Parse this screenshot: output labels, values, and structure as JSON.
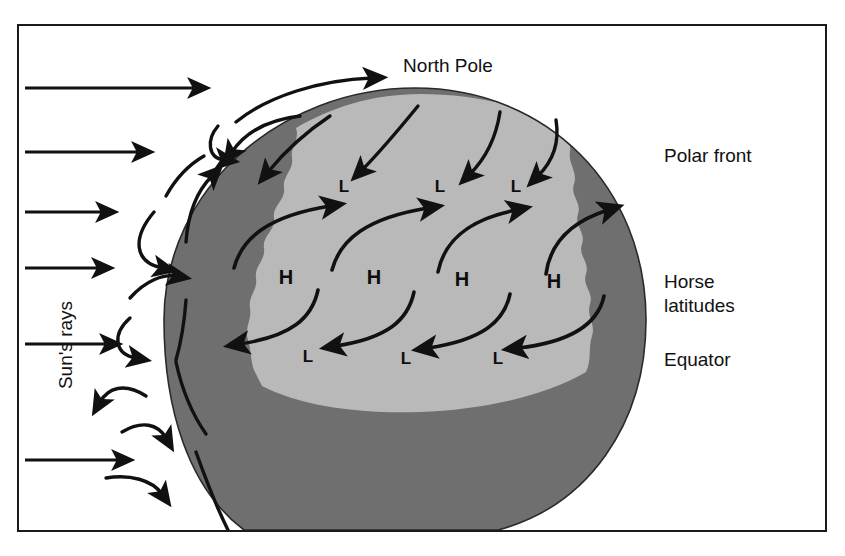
{
  "figure": {
    "type": "diagram",
    "colors": {
      "ink": "#111111",
      "frame": "#1a1a1a",
      "background": "#ffffff",
      "zone_temperate": "#b9b9b9",
      "zone_polar_tropical": "#6f6f6f"
    },
    "labels": {
      "north_pole": "North Pole",
      "polar_front": "Polar front",
      "horse_latitudes_line1": "Horse",
      "horse_latitudes_line2": "latitudes",
      "equator": "Equator",
      "suns_rays": "Sun's rays"
    },
    "pressure_cells": {
      "high_label": "H",
      "low_label": "L",
      "high_count": 4,
      "low_upper_count": 3,
      "low_lower_count": 3,
      "high_positions": [
        {
          "x": 286,
          "y": 284
        },
        {
          "x": 374,
          "y": 284
        },
        {
          "x": 462,
          "y": 286
        },
        {
          "x": 554,
          "y": 288
        }
      ],
      "low_upper_positions": [
        {
          "x": 344,
          "y": 192
        },
        {
          "x": 440,
          "y": 192
        },
        {
          "x": 516,
          "y": 192
        }
      ],
      "low_lower_positions": [
        {
          "x": 308,
          "y": 360
        },
        {
          "x": 406,
          "y": 362
        },
        {
          "x": 498,
          "y": 362
        }
      ]
    },
    "sun_rays": {
      "count": 6,
      "direction": "left-to-right horizontal",
      "ray_y": [
        88,
        152,
        212,
        268,
        344,
        460
      ]
    },
    "zones": [
      {
        "name": "polar cap",
        "shade": "dark"
      },
      {
        "name": "mid-latitude belt",
        "shade": "light"
      },
      {
        "name": "tropical belt",
        "shade": "dark"
      }
    ]
  }
}
